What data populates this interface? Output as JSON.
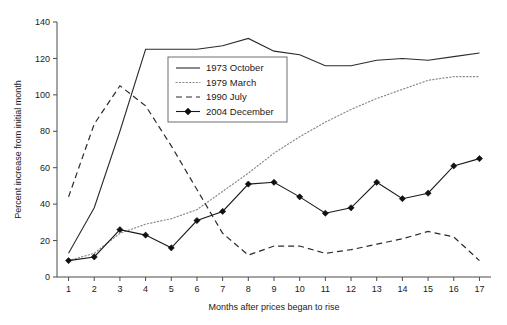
{
  "chart_data": {
    "type": "line",
    "title": "",
    "xlabel": "Months after prices began to rise",
    "ylabel": "Percent increase from initial month",
    "xlim": [
      0.55,
      17.45
    ],
    "ylim": [
      0,
      140
    ],
    "xticks": [
      1,
      2,
      3,
      4,
      5,
      6,
      7,
      8,
      9,
      10,
      11,
      12,
      13,
      14,
      15,
      16,
      17
    ],
    "yticks": [
      0,
      20,
      40,
      60,
      80,
      100,
      120,
      140
    ],
    "grid": false,
    "legend_position": "upper-center-left",
    "x": [
      1,
      2,
      3,
      4,
      5,
      6,
      7,
      8,
      9,
      10,
      11,
      12,
      13,
      14,
      15,
      16,
      17
    ],
    "series": [
      {
        "name": "1973 October",
        "style": "solid",
        "values": [
          13,
          38,
          80,
          125,
          125,
          125,
          127,
          131,
          124,
          122,
          116,
          116,
          119,
          120,
          119,
          121,
          123
        ]
      },
      {
        "name": "1979 March",
        "style": "dotted",
        "values": [
          9,
          13,
          24,
          29,
          32,
          37,
          47,
          57,
          68,
          77,
          85,
          92,
          98,
          103,
          108,
          110,
          110
        ]
      },
      {
        "name": "1990 July",
        "style": "dashed",
        "values": [
          44,
          84,
          105,
          94,
          72,
          48,
          24,
          12,
          17,
          17,
          13,
          15,
          18,
          21,
          25,
          22,
          9
        ]
      },
      {
        "name": "2004 December",
        "style": "solid-marker",
        "values": [
          9,
          11,
          26,
          23,
          16,
          31,
          36,
          51,
          52,
          44,
          35,
          38,
          52,
          43,
          46,
          61,
          65
        ]
      }
    ]
  },
  "legend": {
    "entries": [
      {
        "label": "1973 October",
        "style": "solid"
      },
      {
        "label": "1979 March",
        "style": "dotted"
      },
      {
        "label": "1990 July",
        "style": "dashed"
      },
      {
        "label": "2004 December",
        "style": "solid-marker"
      }
    ]
  },
  "axes": {
    "y_title": "Percent increase from initial month",
    "x_title": "Months after prices began to rise",
    "y_tick_labels": [
      "0",
      "20",
      "40",
      "60",
      "80",
      "100",
      "120",
      "140"
    ],
    "x_tick_labels": [
      "1",
      "2",
      "3",
      "4",
      "5",
      "6",
      "7",
      "8",
      "9",
      "10",
      "11",
      "12",
      "13",
      "14",
      "15",
      "16",
      "17"
    ]
  },
  "colors": {
    "axis": "#4a4a4a",
    "solid_series": "#2b2b2b",
    "dotted_series": "#8a8a8a",
    "dashed_series": "#2b2b2b",
    "marker_series": "#111111",
    "background": "#ffffff"
  }
}
